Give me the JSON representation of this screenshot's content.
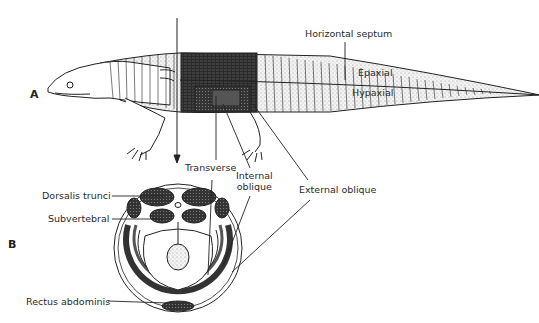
{
  "figure": {
    "panel_a": "A",
    "panel_b": "B"
  },
  "labels": {
    "horizontal_septum": "Horizontal septum",
    "epaxial": "Epaxial",
    "hypaxial": "Hypaxial",
    "transverse": "Transverse",
    "internal_oblique_1": "Internal",
    "internal_oblique_2": "oblique",
    "external_oblique": "External oblique",
    "dorsalis_trunci": "Dorsalis trunci",
    "subvertebral": "Subvertebral",
    "rectus_abdominis": "Rectus abdominis"
  },
  "colors": {
    "ink": "#222222",
    "stipple": "#dcdcdc",
    "dark_band": "#2b2b2b",
    "background": "#ffffff"
  }
}
